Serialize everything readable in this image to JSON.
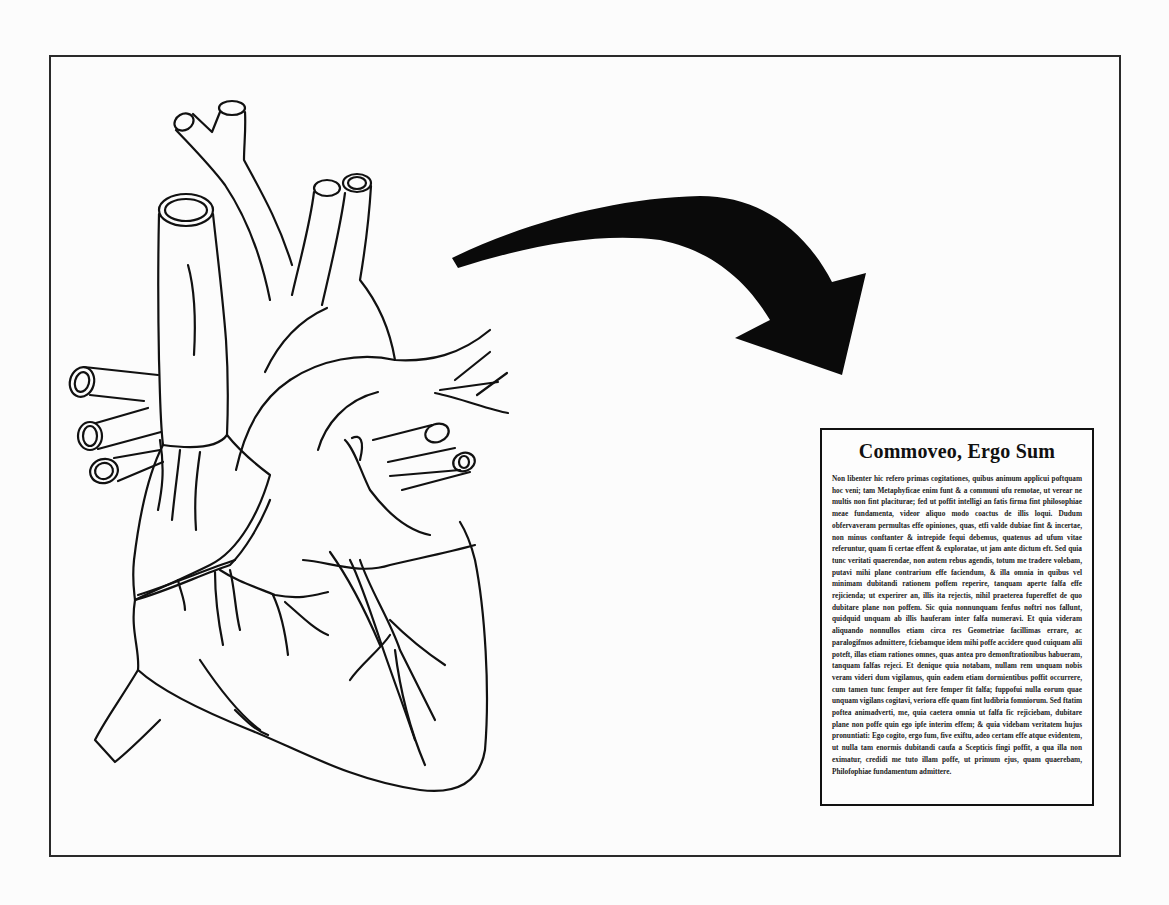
{
  "poster": {
    "title": "Commoveo, Ergo Sum",
    "body": "Non libenter hic refero primas cogitationes, quibus animum applicui poftquam hoc veni; tam Metaphyficae enim funt & a communi ufu remotae, ut verear ne multis non fint placiturae; fed ut poffit intelligi an fatis firma fint philosophiae meae fundamenta, videor aliquo modo coactus de illis loqui. Dudum obfervaveram permultas effe opiniones, quas, etfi valde dubiae fint & incertae, non minus conftanter & intrepide fequi debemus, quatenus ad ufum vitae referuntur, quam fi certae effent & exploratae, ut jam ante dictum eft.  Sed quia tunc veritati quaerendae, non autem rebus agendis, totum me tradere volebam, putavi mihi plane contrarium effe faciendum, & illa omnia in quibus vel minimam dubitandi rationem poffem reperire, tanquam aperte falfa effe rejicienda; ut experirer an, illis ita rejectis, nihil praeterea fupereffet de quo dubitare plane non poffem.  Sic quia nonnunquam fenfus noftri nos fallunt, quidquid unquam ab illis hauferam inter falfa numeravi.  Et quia videram aliquando nonnullos etiam circa res Geometriae facillimas errare, ac paralogifmos admittere, fciebamque idem mihi poffe accidere quod cuiquam alii poteft, illas etiam rationes omnes, quas antea pro demonftrationibus habueram, tanquam falfas rejeci.  Et denique quia notabam, nullam rem unquam nobis veram videri dum vigilamus, quin eadem etiam dormientibus poffit occurrere, cum tamen tunc femper aut fere femper fit falfa; fuppofui nulla eorum quae unquam vigilans cogitavi, veriora effe quam fint ludibria fomniorum.  Sed ftatim poftea animadverti, me, quia caetera omnia ut falfa fic rejiciebam, dubitare plane non poffe quin ego ipfe interim effem; & quia videbam veritatem hujus pronuntiati: Ego cogito, ergo fum, five exiftu, adeo certam effe atque evidentem, ut nulla tam enormis dubitandi caufa a Scepticis fingi poffit, a qua illa non eximatur, credidi me tuto illam poffe, ut primum ejus, quam quaerebam, Philofophiae fundamentum admittere."
  },
  "illustrations": {
    "left": "heart-line-drawing",
    "middle": "curved-arrow-black"
  },
  "colors": {
    "ink": "#111111",
    "paper": "#fcfcfc"
  }
}
